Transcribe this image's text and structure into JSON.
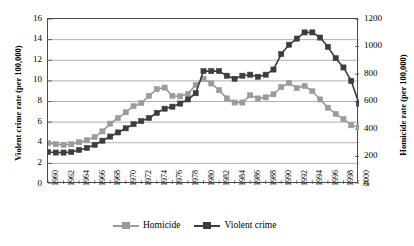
{
  "chart_data": {
    "type": "line",
    "title": "",
    "xlabel": "",
    "x": [
      1960,
      1961,
      1962,
      1963,
      1964,
      1965,
      1966,
      1967,
      1968,
      1969,
      1970,
      1971,
      1972,
      1973,
      1974,
      1975,
      1976,
      1977,
      1978,
      1979,
      1980,
      1981,
      1982,
      1983,
      1984,
      1985,
      1986,
      1987,
      1988,
      1989,
      1990,
      1991,
      1992,
      1993,
      1994,
      1995,
      1996,
      1997,
      1998,
      1999,
      2000
    ],
    "x_tick_labels": [
      "1960",
      "1962",
      "1964",
      "1966",
      "1968",
      "1970",
      "1972",
      "1974",
      "1976",
      "1978",
      "1980",
      "1982",
      "1984",
      "1986",
      "1988",
      "1990",
      "1992",
      "1994",
      "1996",
      "1998",
      "2000"
    ],
    "x_tick_step": 2,
    "xlim": [
      1960,
      2000
    ],
    "grid": true,
    "legend_position": "bottom",
    "axes": [
      {
        "id": "left",
        "label": "Violent crime rate (per 100,000)",
        "ticks": [
          0,
          2,
          4,
          6,
          8,
          10,
          12,
          14,
          16
        ],
        "lim": [
          0,
          16
        ],
        "tick_labels": [
          "0",
          "2",
          "4",
          "6",
          "8",
          "10",
          "12",
          "14",
          "16"
        ]
      },
      {
        "id": "right",
        "label": "Homicide rate (per 100,000)",
        "ticks": [
          0,
          200,
          400,
          600,
          800,
          1000,
          1200
        ],
        "lim": [
          0,
          1200
        ],
        "tick_labels": [
          "0",
          "200",
          "400",
          "600",
          "800",
          "1000",
          "1200"
        ]
      }
    ],
    "series": [
      {
        "name": "Homicide",
        "axis": "left",
        "color": "#9b9b9b",
        "marker": "square",
        "values": [
          3.95,
          3.85,
          3.8,
          3.85,
          4.05,
          4.25,
          4.55,
          5.1,
          5.85,
          6.4,
          6.95,
          7.55,
          7.85,
          8.55,
          9.2,
          9.35,
          8.55,
          8.5,
          8.75,
          9.6,
          10.2,
          9.75,
          9.1,
          8.3,
          7.9,
          7.9,
          8.6,
          8.3,
          8.4,
          8.7,
          9.4,
          9.8,
          9.3,
          9.5,
          9.0,
          8.2,
          7.4,
          6.8,
          6.3,
          5.7,
          5.5
        ],
        "values_right_axis": [
          296,
          289,
          285,
          289,
          304,
          319,
          341,
          383,
          439,
          480,
          521,
          566,
          589,
          641,
          690,
          701,
          641,
          638,
          656,
          720,
          765,
          731,
          683,
          623,
          593,
          593,
          645,
          623,
          630,
          653,
          705,
          735,
          698,
          713,
          675,
          615,
          555,
          510,
          473,
          428,
          413
        ]
      },
      {
        "name": "Violent crime",
        "axis": "left",
        "color": "#3d3d3d",
        "marker": "square",
        "values": [
          3.1,
          3.05,
          3.05,
          3.1,
          3.3,
          3.5,
          3.8,
          4.2,
          4.6,
          5.0,
          5.4,
          5.8,
          6.1,
          6.4,
          6.9,
          7.3,
          7.5,
          7.8,
          8.2,
          8.8,
          10.95,
          10.95,
          10.95,
          10.5,
          10.2,
          10.5,
          10.6,
          10.4,
          10.6,
          11.1,
          12.6,
          13.5,
          14.1,
          14.7,
          14.7,
          14.2,
          13.3,
          12.2,
          11.3,
          10.0,
          7.8
        ],
        "values_right_axis": [
          232,
          229,
          229,
          232,
          247,
          262,
          285,
          315,
          345,
          375,
          405,
          435,
          458,
          480,
          518,
          548,
          563,
          585,
          615,
          660,
          821,
          821,
          821,
          788,
          765,
          788,
          795,
          780,
          795,
          833,
          945,
          1013,
          1058,
          1103,
          1103,
          1065,
          998,
          915,
          848,
          750,
          585
        ]
      }
    ]
  },
  "legend": {
    "items": [
      {
        "label": "Homicide",
        "color": "#9b9b9b"
      },
      {
        "label": "Violent crime",
        "color": "#3d3d3d"
      }
    ]
  }
}
